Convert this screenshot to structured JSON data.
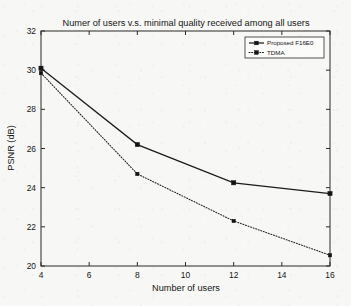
{
  "chart_data": {
    "type": "line",
    "title": "Numer of users v.s. minimal quality received among all users",
    "xlabel": "Number of users",
    "ylabel": "PSNR (dB)",
    "xlim": [
      4,
      16
    ],
    "ylim": [
      20,
      32
    ],
    "xticks": [
      4,
      6,
      8,
      10,
      12,
      14,
      16
    ],
    "yticks": [
      20,
      22,
      24,
      26,
      28,
      30,
      32
    ],
    "xtick_labels": [
      "4",
      "6",
      "8",
      "10",
      "12",
      "14",
      "16"
    ],
    "ytick_labels": [
      "20",
      "22",
      "24",
      "26",
      "28",
      "30",
      "32"
    ],
    "grid": false,
    "legend_position": "top-right",
    "x": [
      4,
      8,
      12,
      16
    ],
    "series": [
      {
        "name": "Proposed F16E0",
        "values": [
          30.1,
          26.2,
          24.25,
          23.7
        ],
        "line_style": "solid",
        "marker": "square",
        "color": "#1c1c1c"
      },
      {
        "name": "TDMA",
        "values": [
          29.85,
          24.7,
          22.3,
          20.55
        ],
        "line_style": "dotted",
        "marker": "square",
        "color": "#1c1c1c"
      }
    ]
  },
  "figure": {
    "background_color": "#f7f7f5",
    "axis_color": "#2b2b2b"
  }
}
